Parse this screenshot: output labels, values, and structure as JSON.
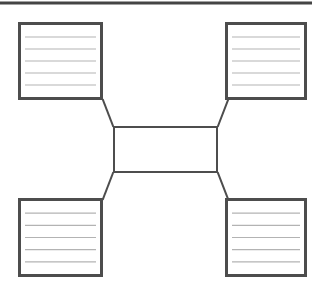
{
  "page": {
    "width": 325,
    "height": 295,
    "background_color": "#ffffff"
  },
  "colors": {
    "box_border": "#4d4d4d",
    "connector": "#4d4d4d",
    "rule_line": "#444444",
    "writing_line": "#b3b3b3",
    "box_fill": "#ffffff"
  },
  "header_rule": {
    "name": "top-horizontal-rule",
    "x1": 0,
    "y1": 3,
    "x2": 312,
    "y2": 3,
    "thickness": 3,
    "color": "#444444"
  },
  "center_node": {
    "label": "",
    "x": 113,
    "y": 126,
    "width": 105,
    "height": 47,
    "border_width": 2,
    "writing_lines": 0
  },
  "boxes": [
    {
      "id": "top-left",
      "label": "",
      "x": 18,
      "y": 22,
      "width": 85,
      "height": 78,
      "border_width": 3,
      "writing_lines": 5,
      "line_values": [
        "",
        "",
        "",
        "",
        ""
      ]
    },
    {
      "id": "top-right",
      "label": "",
      "x": 225,
      "y": 22,
      "width": 82,
      "height": 78,
      "border_width": 3,
      "writing_lines": 5,
      "line_values": [
        "",
        "",
        "",
        "",
        ""
      ]
    },
    {
      "id": "bottom-left",
      "label": "",
      "x": 18,
      "y": 198,
      "width": 85,
      "height": 79,
      "border_width": 3,
      "writing_lines": 5,
      "line_values": [
        "",
        "",
        "",
        "",
        ""
      ]
    },
    {
      "id": "bottom-right",
      "label": "",
      "x": 225,
      "y": 198,
      "width": 82,
      "height": 79,
      "border_width": 3,
      "writing_lines": 5,
      "line_values": [
        "",
        "",
        "",
        "",
        ""
      ]
    }
  ],
  "connectors": [
    {
      "id": "center-to-top-left",
      "x1": 113,
      "y1": 126,
      "x2": 103,
      "y2": 100,
      "thickness": 2
    },
    {
      "id": "center-to-top-right",
      "x1": 218,
      "y1": 126,
      "x2": 228,
      "y2": 100,
      "thickness": 2
    },
    {
      "id": "center-to-bottom-left",
      "x1": 113,
      "y1": 173,
      "x2": 103,
      "y2": 199,
      "thickness": 2
    },
    {
      "id": "center-to-bottom-right",
      "x1": 218,
      "y1": 173,
      "x2": 228,
      "y2": 199,
      "thickness": 2
    }
  ]
}
